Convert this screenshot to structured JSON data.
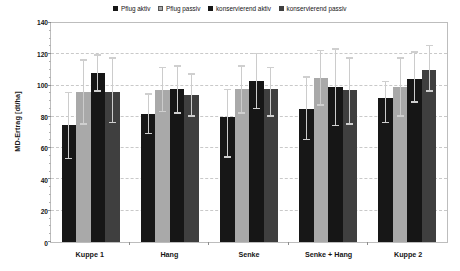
{
  "chart_data": {
    "type": "bar",
    "title": "",
    "subtitle": "",
    "xlabel": "",
    "ylabel": "MD-Ertrag [dt/ha]",
    "ylim": [
      0,
      140
    ],
    "ytick_step": 20,
    "yticks": [
      0,
      20,
      40,
      60,
      80,
      100,
      120,
      140
    ],
    "grid": "horizontal-dashed",
    "legend_position": "top-center",
    "error_bars": "std-dev-whiskers",
    "categories": [
      "Kuppe 1",
      "Hang",
      "Senke",
      "Senke + Hang",
      "Kuppe 2"
    ],
    "series": [
      {
        "name": "Pflug aktiv",
        "color": "#171717",
        "values": [
          75,
          82,
          80,
          85,
          92
        ],
        "err_low": [
          53,
          69,
          54,
          65,
          76
        ],
        "err_high": [
          96,
          95,
          98,
          106,
          103
        ]
      },
      {
        "name": "Pflug passiv",
        "color": "#a9a9a9",
        "values": [
          96,
          97,
          98,
          105,
          99
        ],
        "err_low": [
          75,
          83,
          82,
          87,
          80
        ],
        "err_high": [
          117,
          112,
          113,
          123,
          118
        ]
      },
      {
        "name": "konservierend aktiv",
        "color": "#161616",
        "values": [
          108,
          98,
          103,
          99,
          104
        ],
        "err_low": [
          96,
          82,
          85,
          74,
          89
        ],
        "err_high": [
          120,
          113,
          121,
          124,
          122
        ]
      },
      {
        "name": "konservierend passiv",
        "color": "#3f3f3f",
        "values": [
          96,
          94,
          98,
          97,
          110
        ],
        "err_low": [
          76,
          80,
          80,
          75,
          96
        ],
        "err_high": [
          118,
          108,
          112,
          118,
          126
        ]
      }
    ]
  },
  "legend": {
    "items": [
      {
        "label": "Pflug aktiv",
        "color": "#171717"
      },
      {
        "label": "Pflug passiv",
        "color": "#a9a9a9"
      },
      {
        "label": "konservierend aktiv",
        "color": "#161616"
      },
      {
        "label": "konservierend passiv",
        "color": "#3f3f3f"
      }
    ]
  },
  "axes": {
    "y_label": "MD-Ertrag [dt/ha]",
    "y_tick_labels": [
      "140",
      "120",
      "100",
      "80",
      "60",
      "40",
      "20",
      "0"
    ]
  }
}
